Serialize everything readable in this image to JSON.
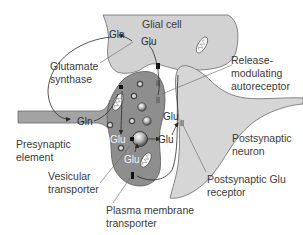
{
  "diagram": {
    "colors": {
      "glial": "#d2d2d2",
      "presynaptic": "#8e8e8e",
      "axon": "#a3a3a3",
      "postsynaptic": "#d6d6d6",
      "line": "#555555",
      "text": "#3a3a3a"
    },
    "compartments": {
      "glial_cell": "Glial cell",
      "presynaptic_element": [
        "Presynaptic",
        "element"
      ],
      "postsynaptic_neuron": [
        "Postsynaptic",
        "neuron"
      ]
    },
    "molecules": {
      "gln_glial": "Gln",
      "glu_glial": "Glu",
      "gln_presynaptic": "Gln",
      "glu_vesicle": "Glu",
      "glu_lower": "Glu",
      "glu_cleft_upper": "Glu",
      "glu_cleft_lower": "Glu"
    },
    "callouts": {
      "glutamate_synthase": [
        "Glutamate",
        "synthase"
      ],
      "release_modulating_autoreceptor": [
        "Release-",
        "modulating",
        "autoreceptor"
      ],
      "vesicular_transporter": [
        "Vesicular",
        "transporter"
      ],
      "plasma_membrane_transporter": [
        "Plasma membrane",
        "transporter"
      ],
      "postsynaptic_glu_receptor": [
        "Postsynaptic Glu",
        "receptor"
      ]
    }
  }
}
